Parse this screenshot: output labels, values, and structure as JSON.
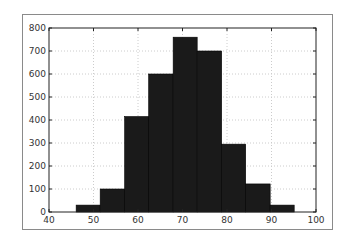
{
  "chart_data": {
    "type": "bar",
    "subtype": "histogram",
    "title": "",
    "xlabel": "",
    "ylabel": "",
    "xlim": [
      40,
      100
    ],
    "ylim": [
      0,
      800
    ],
    "grid": true,
    "legend": null,
    "xticks": [
      40,
      50,
      60,
      70,
      80,
      90,
      100
    ],
    "yticks": [
      0,
      100,
      200,
      300,
      400,
      500,
      600,
      700,
      800
    ],
    "bin_edges": [
      46.1,
      51.5,
      57.0,
      62.4,
      67.9,
      73.3,
      78.8,
      84.2,
      89.7,
      95.1
    ],
    "values": [
      30,
      100,
      415,
      600,
      760,
      700,
      295,
      122,
      30
    ],
    "bar_color": "#1a1a1a",
    "grid_color": "#cccccc"
  }
}
